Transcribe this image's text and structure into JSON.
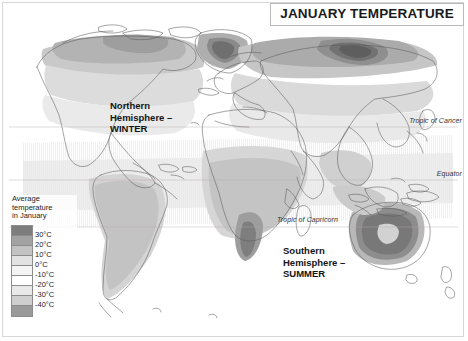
{
  "title": "JANUARY TEMPERATURE",
  "legend": {
    "heading_lines": [
      "Average",
      "temperature",
      "in January"
    ],
    "entries": [
      {
        "label": "30°C",
        "color": "#7d7d7d"
      },
      {
        "label": "20°C",
        "color": "#a2a2a2"
      },
      {
        "label": "10°C",
        "color": "#c2c2c2"
      },
      {
        "label": "0°C",
        "color": "#e2e2e2"
      },
      {
        "label": "-10°C",
        "color": "#f4f4f4"
      },
      {
        "label": "-20°C",
        "color": "#ffffff"
      },
      {
        "label": "-30°C",
        "color": "#e8e8e8"
      },
      {
        "label": "-40°C",
        "color": "#cfcfcf"
      },
      {
        "label": "",
        "color": "#9a9a9a"
      }
    ]
  },
  "latitude_lines": [
    {
      "name": "tropic-of-cancer",
      "label": "Tropic of Cancer"
    },
    {
      "name": "equator",
      "label": "Equator"
    },
    {
      "name": "tropic-of-capricorn",
      "label": "Tropic of Capricorn"
    }
  ],
  "callouts": {
    "north": [
      "Northern",
      "Hemisphere –",
      "WINTER"
    ],
    "south": [
      "Southern",
      "Hemisphere –",
      "SUMMER"
    ]
  },
  "chart_data": {
    "type": "map",
    "title": "JANUARY TEMPERATURE",
    "projection": "world-equirectangular",
    "variable": "Average temperature in January",
    "units": "°C",
    "legend_breaks": [
      30,
      20,
      10,
      0,
      -10,
      -20,
      -30,
      -40
    ],
    "annotations": [
      "Tropic of Cancer",
      "Equator",
      "Tropic of Capricorn",
      "Northern Hemisphere – WINTER",
      "Southern Hemisphere – SUMMER"
    ],
    "notable_regions": [
      {
        "region": "Northeast Siberia",
        "band": "below -40",
        "shade": "darkest-cold"
      },
      {
        "region": "Greenland interior",
        "band": "-30 to -40",
        "shade": "dark-cold"
      },
      {
        "region": "Northern Canada",
        "band": "-20 to -30",
        "shade": "mid-cold"
      },
      {
        "region": "Central Australia",
        "band": "above 30",
        "shade": "darkest-warm"
      },
      {
        "region": "Southern Africa",
        "band": "20 to 30",
        "shade": "warm"
      },
      {
        "region": "Equatorial belt",
        "band": "20 to 30",
        "shade": "warm"
      }
    ]
  }
}
